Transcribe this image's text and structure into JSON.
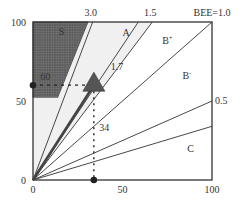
{
  "chart_data": {
    "type": "diagram",
    "title": "",
    "xlabel": "",
    "ylabel": "",
    "xlim": [
      0,
      100
    ],
    "ylim": [
      0,
      100
    ],
    "x_ticks": [
      {
        "value": 0,
        "label": "0"
      },
      {
        "value": 50,
        "label": "50"
      },
      {
        "value": 100,
        "label": "100"
      }
    ],
    "y_ticks": [
      {
        "value": 0,
        "label": "0"
      },
      {
        "value": 50,
        "label": "50"
      },
      {
        "value": 100,
        "label": "100"
      }
    ],
    "ratio_lines": [
      {
        "slope": 3.0,
        "label": "3.0",
        "label_at": "top"
      },
      {
        "slope": 1.5,
        "label": "1.5",
        "label_at": "top"
      },
      {
        "slope": 1.0,
        "label": "BEE=1.0",
        "label_at": "top"
      },
      {
        "slope": 1.7,
        "label": "1.7",
        "label_at": "inside"
      },
      {
        "slope": 0.5,
        "label": "0.5",
        "label_at": "right"
      },
      {
        "slope": 0.34,
        "label": "",
        "label_at": "none"
      }
    ],
    "regions": [
      {
        "id": "S",
        "label": "S",
        "fill": "#6b6b6b",
        "pattern": "dotted",
        "polygon": [
          [
            0,
            52
          ],
          [
            0,
            100
          ],
          [
            31,
            100
          ],
          [
            14,
            52
          ]
        ]
      },
      {
        "id": "A",
        "label": "A",
        "fill": "#f0f0f0",
        "polygon": [
          [
            0,
            0
          ],
          [
            0,
            52
          ],
          [
            14,
            52
          ],
          [
            31,
            100
          ],
          [
            66.7,
            100
          ]
        ]
      }
    ],
    "region_labels": [
      {
        "label": "S",
        "at": [
          16,
          92
        ]
      },
      {
        "label": "A",
        "at": [
          52,
          91
        ]
      },
      {
        "label": "B",
        "sup": "+",
        "at": [
          75,
          86
        ]
      },
      {
        "label": "B",
        "sup": "-",
        "at": [
          86,
          64
        ]
      },
      {
        "label": "C",
        "at": [
          88,
          18
        ]
      }
    ],
    "marker": {
      "shape": "triangle",
      "x": 34,
      "y": 60,
      "fill": "#555555",
      "x_readout": "34",
      "y_readout": "60"
    },
    "arrow": {
      "from": [
        0,
        0
      ],
      "to": [
        34,
        60
      ],
      "color": "#444444"
    },
    "guide_points": [
      {
        "axis": "x",
        "value": 34
      },
      {
        "axis": "y",
        "value": 60
      }
    ],
    "annotations": [
      {
        "text": "60",
        "at": [
          4,
          63
        ]
      },
      {
        "text": "34",
        "at": [
          37,
          31
        ]
      }
    ]
  }
}
